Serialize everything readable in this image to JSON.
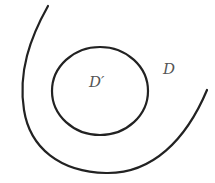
{
  "diagram": {
    "type": "region-diagram",
    "outer_region": {
      "label": "D",
      "stroke_color": "#222222"
    },
    "inner_region": {
      "label": "D′",
      "stroke_color": "#222222"
    },
    "label_color": "#555555"
  }
}
